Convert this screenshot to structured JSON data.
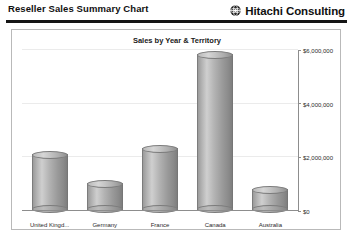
{
  "header": {
    "report_title": "Reseller Sales Summary Chart",
    "brand_name": "Hitachi Consulting",
    "logo_icon": "hitachi-globe-logo-icon"
  },
  "chart_data": {
    "type": "bar",
    "title": "Sales by Year & Territory",
    "xlabel": "",
    "ylabel": "",
    "categories": [
      "United Kingd...",
      "Germany",
      "France",
      "Canada",
      "Australia"
    ],
    "values": [
      2080000,
      1000000,
      2320000,
      5800000,
      800000
    ],
    "ylim": [
      0,
      6000000
    ],
    "ytick_values": [
      6000000,
      4000000,
      2000000,
      0
    ],
    "ytick_labels": [
      "$6,000,000",
      "$4,000,000",
      "$2,000,000",
      "$0"
    ],
    "grid": true,
    "legend": false,
    "axis_position": "right",
    "bar_style": "3d-cylinder",
    "bar_color": "#a8a8a8"
  }
}
